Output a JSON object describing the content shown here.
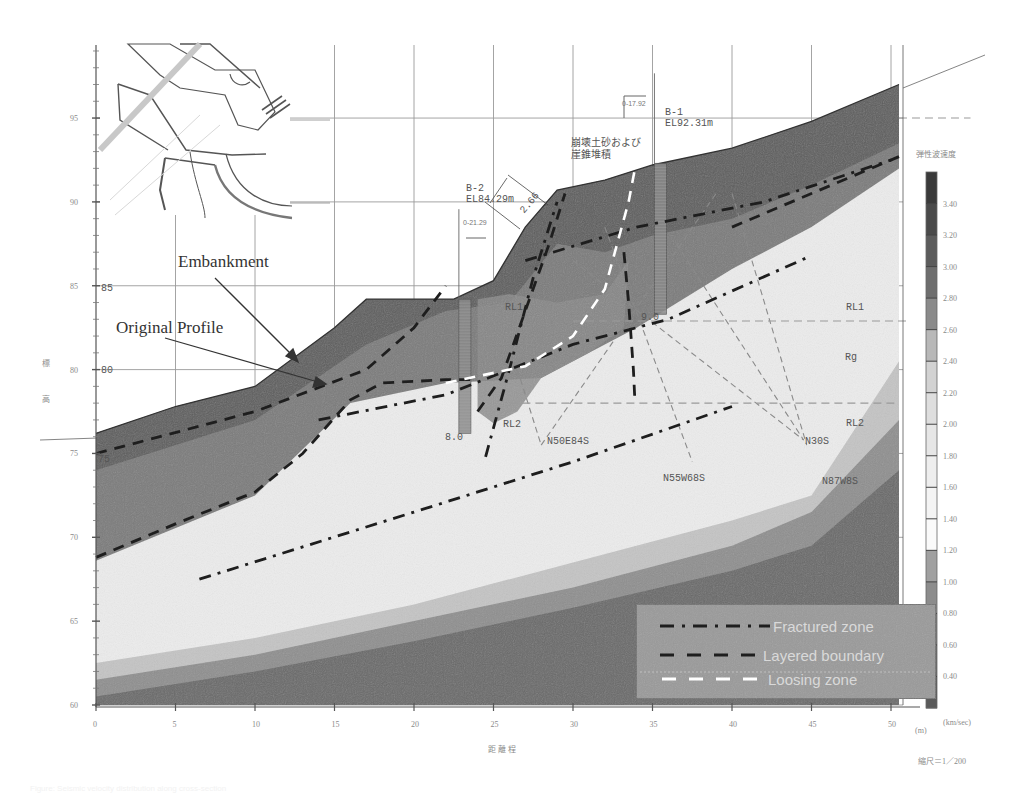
{
  "chart_data": {
    "type": "cross-section",
    "title": "",
    "xlabel": "距離程",
    "xlabel_unit": "(m)",
    "ylabel": "標高",
    "scale_note": "縮尺＝1／200",
    "x_ticks": [
      0,
      5,
      10,
      15,
      20,
      25,
      30,
      35,
      40,
      45,
      50
    ],
    "y_ticks": [
      60,
      65,
      70,
      75,
      80,
      85,
      90,
      95
    ],
    "xlim": [
      0,
      51
    ],
    "ylim": [
      60,
      98
    ],
    "grid": true,
    "colorbar": {
      "title": "弾性波速度",
      "unit": "(km/sec)",
      "ticks": [
        "3.40",
        "3.20",
        "3.00",
        "2.80",
        "2.60",
        "2.40",
        "2.20",
        "2.00",
        "1.80",
        "1.60",
        "1.40",
        "1.20",
        "1.00",
        "0.80",
        "0.60",
        "0.40"
      ],
      "bands": [
        "#3a3a3a",
        "#4a4a4a",
        "#5c5c5c",
        "#6e6e6e",
        "#8a8a8a",
        "#b8b8b8",
        "#d2d2d2",
        "#dedede",
        "#e6e6e6",
        "#eeeeee",
        "#f4f4f4",
        "#fafafa",
        "#a0a0a0",
        "#8c8c8c",
        "#7a7a7a",
        "#6a6a6a",
        "#5a5a5a"
      ]
    },
    "ground_surface": [
      [
        0,
        76.2
      ],
      [
        5,
        77.8
      ],
      [
        10,
        79.0
      ],
      [
        15,
        82.5
      ],
      [
        17,
        84.2
      ],
      [
        22.5,
        84.2
      ],
      [
        25,
        85.3
      ],
      [
        27,
        88.5
      ],
      [
        29,
        90.7
      ],
      [
        32,
        91.3
      ],
      [
        35,
        92.2
      ],
      [
        40,
        93.2
      ],
      [
        45,
        94.8
      ],
      [
        50.5,
        97.0
      ]
    ],
    "velocity_layers": [
      {
        "name": "surface",
        "color": "#5f5f5f",
        "bottom": [
          [
            0,
            68.8
          ],
          [
            5,
            70.8
          ],
          [
            10,
            72.7
          ],
          [
            13,
            75.0
          ],
          [
            16,
            78.2
          ],
          [
            18,
            79.2
          ],
          [
            22,
            79.4
          ],
          [
            24,
            79.4
          ],
          [
            25,
            77.5
          ],
          [
            26,
            78.0
          ],
          [
            28,
            80.0
          ],
          [
            31,
            81.5
          ],
          [
            34,
            83.0
          ],
          [
            40,
            86.5
          ],
          [
            45,
            89.0
          ],
          [
            50.5,
            92.5
          ]
        ]
      },
      {
        "name": "mid",
        "color": "#7c7c7c",
        "bottom": [
          [
            0,
            68.6
          ],
          [
            10,
            72.5
          ],
          [
            16,
            78.0
          ],
          [
            22,
            79.2
          ],
          [
            28,
            79.5
          ],
          [
            34,
            82.5
          ],
          [
            40,
            86.0
          ],
          [
            45,
            88.5
          ],
          [
            50.5,
            92.0
          ]
        ]
      },
      {
        "name": "core-light",
        "color": "#ececec"
      },
      {
        "name": "deep1",
        "color": "#c4c4c4",
        "top": [
          [
            0,
            62.5
          ],
          [
            10,
            64.0
          ],
          [
            20,
            66.0
          ],
          [
            30,
            68.5
          ],
          [
            40,
            71.0
          ],
          [
            45,
            72.5
          ],
          [
            50.5,
            80.5
          ]
        ]
      },
      {
        "name": "deep2",
        "color": "#8f8f8f",
        "top": [
          [
            0,
            61.5
          ],
          [
            10,
            63.0
          ],
          [
            20,
            65.0
          ],
          [
            30,
            67.0
          ],
          [
            40,
            69.5
          ],
          [
            45,
            71.5
          ],
          [
            50.5,
            77.0
          ]
        ]
      },
      {
        "name": "deep3",
        "color": "#6a6a6a",
        "top": [
          [
            0,
            60.5
          ],
          [
            10,
            62.0
          ],
          [
            20,
            63.8
          ],
          [
            30,
            65.8
          ],
          [
            40,
            68.0
          ],
          [
            45,
            69.5
          ],
          [
            50.5,
            74.0
          ]
        ]
      }
    ],
    "lines": [
      {
        "name": "Fractured zone",
        "style": "dash-dot",
        "color": "#1e1e1e",
        "points": [
          [
            6.5,
            67.5
          ],
          [
            20,
            71.5
          ],
          [
            30,
            74.5
          ],
          [
            40,
            77.8
          ]
        ]
      },
      {
        "name": "Fractured zone",
        "style": "dash-dot",
        "color": "#1e1e1e",
        "points": [
          [
            14,
            77.0
          ],
          [
            22,
            78.5
          ],
          [
            30,
            81.5
          ],
          [
            36,
            83.0
          ],
          [
            45,
            86.8
          ]
        ]
      },
      {
        "name": "Fractured zone",
        "style": "dash-dot",
        "color": "#1e1e1e",
        "points": [
          [
            27,
            86.5
          ],
          [
            34,
            88.5
          ],
          [
            42,
            90.0
          ],
          [
            50,
            92.5
          ]
        ]
      },
      {
        "name": "Fractured zone",
        "style": "dash-dot",
        "color": "#1e1e1e",
        "points": [
          [
            24.5,
            74.8
          ],
          [
            26,
            80.0
          ],
          [
            27.5,
            85.5
          ],
          [
            29,
            90.0
          ]
        ]
      },
      {
        "name": "Layered boundary",
        "style": "dash",
        "color": "#1e1e1e",
        "points": [
          [
            0,
            75.0
          ],
          [
            10,
            77.5
          ],
          [
            17,
            80.0
          ],
          [
            20,
            82.5
          ],
          [
            22,
            85.0
          ]
        ]
      },
      {
        "name": "Layered boundary",
        "style": "dash",
        "color": "#1e1e1e",
        "points": [
          [
            0,
            68.8
          ],
          [
            5,
            70.8
          ],
          [
            10,
            72.7
          ],
          [
            13,
            75.0
          ],
          [
            16,
            78.2
          ],
          [
            18,
            79.2
          ],
          [
            22,
            79.4
          ],
          [
            24,
            79.4
          ]
        ]
      },
      {
        "name": "Layered boundary",
        "style": "dash",
        "color": "#1e1e1e",
        "points": [
          [
            24,
            77.5
          ],
          [
            25.5,
            79.5
          ],
          [
            27,
            83.5
          ],
          [
            28.5,
            87.5
          ],
          [
            29.5,
            90.5
          ]
        ]
      },
      {
        "name": "Layered boundary",
        "style": "dash",
        "color": "#1e1e1e",
        "points": [
          [
            33.2,
            87.0
          ],
          [
            33.5,
            84.0
          ],
          [
            33.8,
            80.0
          ],
          [
            33.9,
            78.0
          ]
        ]
      },
      {
        "name": "Layered boundary",
        "style": "dash",
        "color": "#1e1e1e",
        "points": [
          [
            40,
            88.5
          ],
          [
            45,
            90.5
          ],
          [
            50.5,
            92.7
          ]
        ]
      },
      {
        "name": "Loosing zone",
        "style": "dash",
        "color": "#ffffff",
        "points": [
          [
            22,
            79.2
          ],
          [
            27,
            80.2
          ],
          [
            30,
            82.0
          ],
          [
            32,
            84.8
          ],
          [
            33.5,
            90.0
          ],
          [
            34,
            92.5
          ]
        ]
      }
    ],
    "discontinuities": [
      {
        "label": "N50E84S",
        "points": [
          [
            26.5,
            80.0
          ],
          [
            28,
            75.5
          ]
        ]
      },
      {
        "label": "N50E84S",
        "points": [
          [
            28,
            75.5
          ],
          [
            39,
            90.5
          ]
        ]
      },
      {
        "label": "N55W68S",
        "points": [
          [
            32,
            88.5
          ],
          [
            37.5,
            74.5
          ]
        ]
      },
      {
        "label": "N30S",
        "points": [
          [
            36.5,
            87.5
          ],
          [
            44.5,
            75.8
          ]
        ]
      },
      {
        "label": "N30S",
        "points": [
          [
            30,
            86.5
          ],
          [
            44.5,
            75.8
          ]
        ]
      },
      {
        "label": "N87W8S",
        "points": [
          [
            40,
            90.5
          ],
          [
            44.7,
            75.5
          ]
        ]
      }
    ],
    "horizontal_dashed": [
      {
        "y": 82.9,
        "x": [
          30,
          51
        ]
      },
      {
        "y": 78.0,
        "x": [
          26,
          50.5
        ]
      },
      {
        "y": 95.0,
        "x": [
          50.5,
          55
        ]
      }
    ],
    "boreholes": [
      {
        "name": "B-2",
        "elevation": "EL84.29m",
        "offset": "0-21.29",
        "depth_label": "8.0",
        "x": 23.2,
        "top": 84.2,
        "bottom": 76.2
      },
      {
        "name": "B-1",
        "elevation": "EL92.31m",
        "offset": "0-17.92",
        "depth_label": "9.0",
        "x": 35.5,
        "top": 92.3,
        "bottom": 83.3
      }
    ]
  },
  "annotations": {
    "embankment": "Embankment",
    "original_profile": "Original Profile",
    "jp_note_line1": "崩壊土砂および",
    "jp_note_line2": "崖錐堆積",
    "rl1_left": "RL1",
    "rl1_right": "RL1",
    "rl2_left": "RL2",
    "rl2_right": "RL2",
    "rg": "Rg",
    "n50e84s": "N50E84S",
    "n55w68s": "N55W68S",
    "n30s": "N30S",
    "n87w8s": "N87W8S",
    "dim_266": "2.66",
    "b2_name": "B-2",
    "b2_el": "EL84.29m",
    "b2_offset": "0-21.29",
    "b2_depth": "8.0",
    "b1_name": "B-1",
    "b1_el": "EL92.31m",
    "b1_offset": "0-17.92",
    "b1_depth": "9.0",
    "inner_85": "85",
    "inner_80": "80",
    "inner_75": "75"
  },
  "legend": {
    "items": [
      {
        "label": "Fractured zone",
        "style": "dash-dot",
        "color": "#1e1e1e"
      },
      {
        "label": "Layered boundary",
        "style": "dash",
        "color": "#1e1e1e"
      },
      {
        "label": "Loosing zone",
        "style": "dash",
        "color": "#ffffff"
      }
    ],
    "background": "#9a9a9a"
  },
  "axis": {
    "ylabel_char1": "標",
    "ylabel_char2": "高",
    "xlabel": "距 離 程",
    "xunit": "(m)",
    "scale": "縮尺＝1／200",
    "colorbar_title": "弾性波速度",
    "colorbar_unit": "(km/sec)"
  },
  "caption": "Figure: Seismic velocity distribution along cross-section"
}
